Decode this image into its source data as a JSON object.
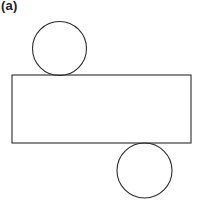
{
  "figure": {
    "label": "(a)",
    "stroke_color": "#2a2a2a",
    "background": "#ffffff"
  },
  "shapes": {
    "top_circle": {
      "cx": 59.5,
      "cy": 48.5,
      "r": 27
    },
    "rectangle": {
      "x": 12,
      "y": 75,
      "width": 179,
      "height": 68
    },
    "bottom_circle": {
      "cx": 144.5,
      "cy": 170.5,
      "r": 27.5
    }
  }
}
